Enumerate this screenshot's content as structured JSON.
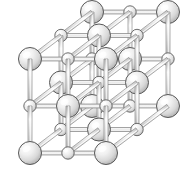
{
  "figure": {
    "name": "crystal-lattice-diagram",
    "structure_type": "rock-salt (NaCl-type) face-centered cubic lattice",
    "background_color": "#ffffff",
    "width": 196,
    "height": 170
  },
  "lattice": {
    "grid": {
      "nx": 3,
      "ny": 3,
      "nz": 3
    },
    "origin": {
      "x": 30,
      "y": 153
    },
    "step_x": {
      "dx": 38,
      "dy": 0
    },
    "step_y": {
      "dx": 0,
      "dy": -47
    },
    "step_z": {
      "dx": 31,
      "dy": -23.5
    },
    "atoms": {
      "large": {
        "label": "large-atom",
        "radius": 11.5,
        "fill_light": "#fbfbfb",
        "fill_mid": "#e2e2e2",
        "fill_dark": "#b4b4b4",
        "stroke": "#585858",
        "stroke_width": 1.0
      },
      "small": {
        "label": "small-atom",
        "radius": 6.2,
        "fill_light": "#fcfcfc",
        "fill_mid": "#e6e6e6",
        "fill_dark": "#bcbcbc",
        "stroke": "#5e5e5e",
        "stroke_width": 0.9
      }
    },
    "bonds": {
      "label": "bond-rod",
      "thickness": 4.0,
      "fill_light": "#fafafa",
      "fill_mid": "#dcdcdc",
      "fill_dark": "#bdbdbd",
      "stroke": "#8a8a8a",
      "stroke_width": 0.7
    }
  },
  "chart_data": {
    "type": "scatter",
    "xlabel": "",
    "ylabel": "",
    "grid": false,
    "legend": null,
    "series": [
      {
        "name": "large-atom",
        "count": 14,
        "radius_px": 11.5
      },
      {
        "name": "small-atom",
        "count": 13,
        "radius_px": 6.2
      }
    ],
    "sites": [
      {
        "i": 0,
        "j": 0,
        "k": 0,
        "species": "large",
        "x": 30,
        "y": 153
      },
      {
        "i": 1,
        "j": 0,
        "k": 0,
        "species": "small",
        "x": 68,
        "y": 153
      },
      {
        "i": 2,
        "j": 0,
        "k": 0,
        "species": "large",
        "x": 106,
        "y": 153
      },
      {
        "i": 0,
        "j": 1,
        "k": 0,
        "species": "small",
        "x": 30,
        "y": 106
      },
      {
        "i": 1,
        "j": 1,
        "k": 0,
        "species": "large",
        "x": 68,
        "y": 106
      },
      {
        "i": 2,
        "j": 1,
        "k": 0,
        "species": "small",
        "x": 106,
        "y": 106
      },
      {
        "i": 0,
        "j": 2,
        "k": 0,
        "species": "large",
        "x": 30,
        "y": 59
      },
      {
        "i": 1,
        "j": 2,
        "k": 0,
        "species": "small",
        "x": 68,
        "y": 59
      },
      {
        "i": 2,
        "j": 2,
        "k": 0,
        "species": "large",
        "x": 106,
        "y": 59
      },
      {
        "i": 0,
        "j": 0,
        "k": 1,
        "species": "small",
        "x": 61,
        "y": 129.5
      },
      {
        "i": 1,
        "j": 0,
        "k": 1,
        "species": "large",
        "x": 99,
        "y": 129.5
      },
      {
        "i": 2,
        "j": 0,
        "k": 1,
        "species": "small",
        "x": 137,
        "y": 129.5
      },
      {
        "i": 0,
        "j": 1,
        "k": 1,
        "species": "large",
        "x": 61,
        "y": 82.5
      },
      {
        "i": 1,
        "j": 1,
        "k": 1,
        "species": "small",
        "x": 99,
        "y": 82.5
      },
      {
        "i": 2,
        "j": 1,
        "k": 1,
        "species": "large",
        "x": 137,
        "y": 82.5
      },
      {
        "i": 0,
        "j": 2,
        "k": 1,
        "species": "small",
        "x": 61,
        "y": 35.5
      },
      {
        "i": 1,
        "j": 2,
        "k": 1,
        "species": "large",
        "x": 99,
        "y": 35.5
      },
      {
        "i": 2,
        "j": 2,
        "k": 1,
        "species": "small",
        "x": 137,
        "y": 35.5
      },
      {
        "i": 0,
        "j": 0,
        "k": 2,
        "species": "large",
        "x": 92,
        "y": 106
      },
      {
        "i": 1,
        "j": 0,
        "k": 2,
        "species": "small",
        "x": 130,
        "y": 106
      },
      {
        "i": 2,
        "j": 0,
        "k": 2,
        "species": "large",
        "x": 168,
        "y": 106
      },
      {
        "i": 0,
        "j": 1,
        "k": 2,
        "species": "small",
        "x": 92,
        "y": 59
      },
      {
        "i": 1,
        "j": 1,
        "k": 2,
        "species": "large",
        "x": 130,
        "y": 59
      },
      {
        "i": 2,
        "j": 1,
        "k": 2,
        "species": "small",
        "x": 168,
        "y": 59
      },
      {
        "i": 0,
        "j": 2,
        "k": 2,
        "species": "large",
        "x": 92,
        "y": 12
      },
      {
        "i": 1,
        "j": 2,
        "k": 2,
        "species": "small",
        "x": 130,
        "y": 12
      },
      {
        "i": 2,
        "j": 2,
        "k": 2,
        "species": "large",
        "x": 168,
        "y": 12
      }
    ]
  }
}
